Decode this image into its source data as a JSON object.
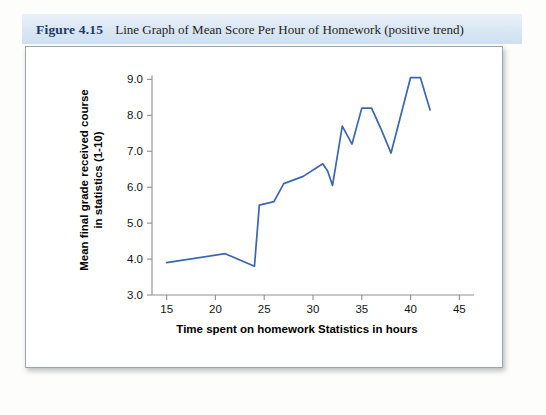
{
  "figure": {
    "number": "Figure 4.15",
    "caption": "Line Graph of Mean Score Per Hour of Homework (positive trend)",
    "header_bg": "#dbe8f4",
    "number_color": "#1b3a6b"
  },
  "chart_data": {
    "type": "line",
    "title": "",
    "xlabel": "Time spent on homework Statistics in hours",
    "ylabel": "Mean final grade received course in statistics (1-10)",
    "xlim": [
      13.5,
      46.5
    ],
    "ylim": [
      3.0,
      9.4
    ],
    "xticks": [
      15,
      20,
      25,
      30,
      35,
      40,
      45
    ],
    "xtick_labels": [
      "15",
      "20",
      "25",
      "30",
      "35",
      "40",
      "45"
    ],
    "yticks": [
      3.0,
      4.0,
      5.0,
      6.0,
      7.0,
      8.0,
      9.0
    ],
    "ytick_labels": [
      "3.0",
      "4.0",
      "5.0",
      "6.0",
      "7.0",
      "8.0",
      "9.0"
    ],
    "grid": false,
    "legend": "none",
    "series": [
      {
        "name": "Mean final grade",
        "color": "#3b66b0",
        "x": [
          15,
          21,
          24,
          24.5,
          26,
          27,
          29,
          31,
          31.5,
          32,
          33,
          34,
          35,
          36,
          37,
          38,
          40,
          41,
          42
        ],
        "y": [
          3.9,
          4.15,
          3.8,
          5.5,
          5.6,
          6.1,
          6.3,
          6.65,
          6.45,
          6.05,
          7.7,
          7.2,
          8.2,
          8.2,
          7.6,
          6.95,
          9.05,
          9.05,
          8.15
        ]
      }
    ]
  }
}
